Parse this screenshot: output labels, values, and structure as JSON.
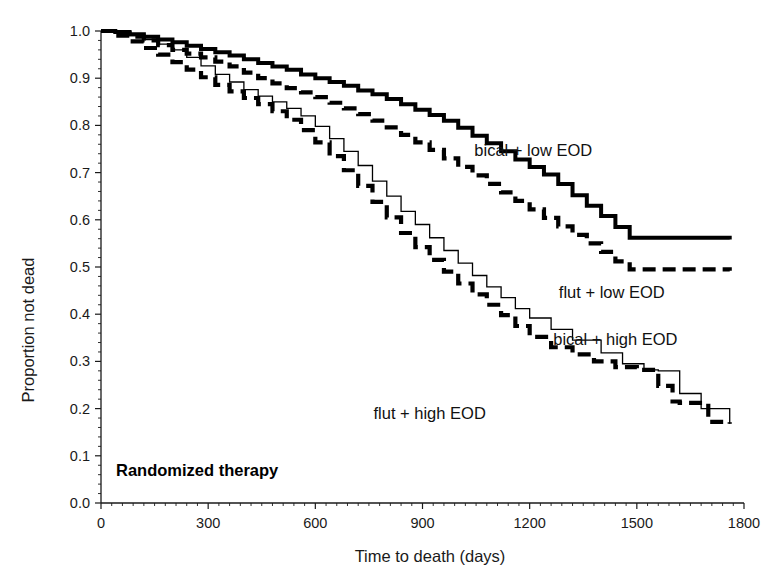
{
  "chart_data": {
    "type": "line",
    "title": "",
    "annotation": "Randomized therapy",
    "xlabel": "Time  to death (days)",
    "ylabel": "Proportion not dead",
    "xlim": [
      0,
      1800
    ],
    "ylim": [
      0.0,
      1.0
    ],
    "xticks": [
      0,
      300,
      600,
      900,
      1200,
      1500,
      1800
    ],
    "xtick_labels": [
      "0",
      "300",
      "600",
      "900",
      "1200",
      "1500",
      "1800"
    ],
    "yticks": [
      0.0,
      0.1,
      0.2,
      0.3,
      0.4,
      0.5,
      0.6,
      0.7,
      0.8,
      0.9,
      1.0
    ],
    "ytick_labels": [
      "0.0",
      "0.1",
      "0.2",
      "0.3",
      "0.4",
      "0.5",
      "0.6",
      "0.7",
      "0.8",
      "0.9",
      "1.0"
    ],
    "grid": false,
    "legend_position": "inline-annotations",
    "series": [
      {
        "name": "bical + low EOD",
        "style": "solid-thick",
        "label_x": 1210,
        "label_y": 0.735,
        "x": [
          0,
          40,
          80,
          120,
          160,
          200,
          240,
          280,
          320,
          360,
          400,
          440,
          480,
          520,
          560,
          600,
          640,
          680,
          720,
          760,
          800,
          840,
          880,
          920,
          960,
          1000,
          1040,
          1080,
          1120,
          1160,
          1200,
          1240,
          1280,
          1320,
          1360,
          1400,
          1440,
          1480,
          1760
        ],
        "y": [
          1.0,
          0.998,
          0.993,
          0.988,
          0.982,
          0.976,
          0.969,
          0.962,
          0.955,
          0.948,
          0.94,
          0.932,
          0.925,
          0.918,
          0.908,
          0.9,
          0.892,
          0.884,
          0.874,
          0.866,
          0.856,
          0.845,
          0.833,
          0.822,
          0.81,
          0.795,
          0.778,
          0.762,
          0.745,
          0.728,
          0.712,
          0.696,
          0.676,
          0.652,
          0.63,
          0.608,
          0.585,
          0.562,
          0.558
        ]
      },
      {
        "name": "flut + low EOD",
        "style": "dashed-thick",
        "label_x": 1430,
        "label_y": 0.435,
        "x": [
          0,
          40,
          80,
          120,
          160,
          200,
          240,
          280,
          320,
          360,
          400,
          440,
          480,
          520,
          560,
          600,
          640,
          680,
          720,
          760,
          800,
          840,
          880,
          920,
          960,
          1000,
          1040,
          1080,
          1120,
          1160,
          1200,
          1240,
          1280,
          1320,
          1360,
          1400,
          1440,
          1480,
          1760
        ],
        "y": [
          1.0,
          0.995,
          0.988,
          0.98,
          0.97,
          0.96,
          0.952,
          0.944,
          0.935,
          0.925,
          0.912,
          0.9,
          0.889,
          0.879,
          0.87,
          0.86,
          0.848,
          0.836,
          0.824,
          0.81,
          0.796,
          0.78,
          0.764,
          0.748,
          0.73,
          0.712,
          0.694,
          0.676,
          0.658,
          0.64,
          0.622,
          0.604,
          0.586,
          0.568,
          0.55,
          0.532,
          0.512,
          0.495,
          0.492
        ]
      },
      {
        "name": "bical + high EOD",
        "style": "thin-solid",
        "label_x": 1440,
        "label_y": 0.335,
        "x": [
          0,
          40,
          80,
          120,
          160,
          200,
          240,
          280,
          320,
          360,
          400,
          440,
          480,
          520,
          560,
          600,
          640,
          680,
          720,
          760,
          800,
          840,
          880,
          920,
          960,
          1000,
          1040,
          1080,
          1120,
          1160,
          1200,
          1260,
          1320,
          1400,
          1460,
          1520,
          1560,
          1620,
          1680,
          1760
        ],
        "y": [
          1.0,
          0.996,
          0.99,
          0.982,
          0.972,
          0.96,
          0.944,
          0.926,
          0.908,
          0.892,
          0.876,
          0.862,
          0.85,
          0.836,
          0.82,
          0.798,
          0.772,
          0.745,
          0.715,
          0.682,
          0.65,
          0.618,
          0.59,
          0.562,
          0.535,
          0.508,
          0.482,
          0.458,
          0.435,
          0.412,
          0.392,
          0.368,
          0.345,
          0.318,
          0.295,
          0.282,
          0.28,
          0.232,
          0.2,
          0.168
        ]
      },
      {
        "name": "flut + high EOD",
        "style": "dashed-thick",
        "label_x": 920,
        "label_y": 0.178,
        "x": [
          0,
          40,
          80,
          120,
          160,
          200,
          240,
          280,
          320,
          360,
          400,
          440,
          480,
          520,
          560,
          600,
          640,
          680,
          720,
          760,
          800,
          840,
          880,
          920,
          960,
          1000,
          1040,
          1080,
          1120,
          1160,
          1200,
          1260,
          1320,
          1380,
          1440,
          1500,
          1560,
          1600,
          1620,
          1700,
          1760
        ],
        "y": [
          1.0,
          0.99,
          0.978,
          0.964,
          0.95,
          0.934,
          0.918,
          0.902,
          0.886,
          0.872,
          0.858,
          0.845,
          0.83,
          0.812,
          0.79,
          0.764,
          0.735,
          0.705,
          0.672,
          0.638,
          0.605,
          0.572,
          0.542,
          0.515,
          0.49,
          0.465,
          0.442,
          0.42,
          0.398,
          0.375,
          0.352,
          0.33,
          0.315,
          0.3,
          0.288,
          0.282,
          0.248,
          0.215,
          0.212,
          0.172,
          0.168
        ]
      }
    ]
  }
}
